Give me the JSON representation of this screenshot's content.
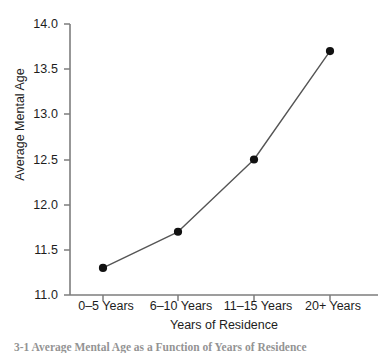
{
  "chart_data": {
    "type": "line",
    "title": "",
    "subtitle": "",
    "xlabel": "Years of Residence",
    "ylabel": "Average Mental Age",
    "categories": [
      "0–5 Years",
      "6–10 Years",
      "11–15 Years",
      "20+ Years"
    ],
    "values": [
      11.3,
      11.7,
      12.5,
      13.7
    ],
    "series": [
      {
        "name": "Average Mental Age",
        "values": [
          11.3,
          11.7,
          12.5,
          13.7
        ]
      }
    ],
    "ylim": [
      11.0,
      14.0
    ],
    "yticks": [
      "11.0",
      "11.5",
      "12.0",
      "12.5",
      "13.0",
      "13.5",
      "14.0"
    ],
    "ytick_values": [
      11.0,
      11.5,
      12.0,
      12.5,
      13.0,
      13.5,
      14.0
    ],
    "grid": false,
    "legend": false,
    "legend_position": "none",
    "marker": "filled-circle",
    "line_color": "#555555",
    "marker_color": "#111111",
    "axis_color": "#7d7d7d"
  },
  "axes": {
    "y_title": "Average Mental Age",
    "x_title": "Years of Residence"
  },
  "caption": {
    "text": "3-1   Average Mental Age as a Function of Years of Residence"
  }
}
